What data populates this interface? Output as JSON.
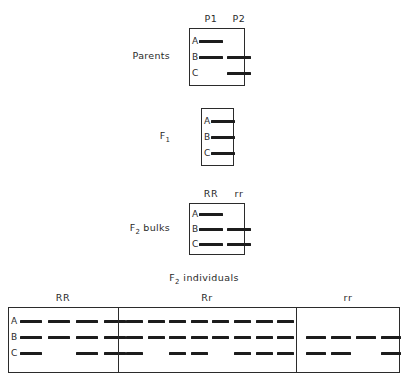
{
  "figure": {
    "type": "gel-band-diagram",
    "row_labels": [
      "A",
      "B",
      "C"
    ],
    "panels": [
      {
        "id": "parents",
        "side_label": "Parents",
        "side_label_sub": "",
        "column_headers": [
          "P1",
          "P2"
        ],
        "lane_count": 2,
        "bands": [
          {
            "row": "A",
            "lanes": [
              1
            ]
          },
          {
            "row": "B",
            "lanes": [
              1,
              2
            ]
          },
          {
            "row": "C",
            "lanes": [
              2
            ]
          }
        ]
      },
      {
        "id": "f1",
        "side_label": "F",
        "side_label_sub": "1",
        "column_headers": [],
        "lane_count": 1,
        "bands": [
          {
            "row": "A",
            "lanes": [
              1
            ]
          },
          {
            "row": "B",
            "lanes": [
              1
            ]
          },
          {
            "row": "C",
            "lanes": [
              1
            ]
          }
        ]
      },
      {
        "id": "f2-bulks",
        "side_label": "F",
        "side_label_sub": "2",
        "side_label_tail": " bulks",
        "column_headers": [
          "RR",
          "rr"
        ],
        "lane_count": 2,
        "bands": [
          {
            "row": "A",
            "lanes": [
              1
            ]
          },
          {
            "row": "B",
            "lanes": [
              1,
              2
            ]
          },
          {
            "row": "C",
            "lanes": [
              1,
              2
            ]
          }
        ]
      }
    ],
    "bottom_panel": {
      "id": "f2-individuals",
      "title": "F",
      "title_sub": "2",
      "title_tail": " individuals",
      "groups": [
        {
          "id": "group-rr-homozygous-dominant",
          "label": "RR",
          "lane_count": 4,
          "bands": [
            {
              "row": "A",
              "lanes": [
                1,
                2,
                3,
                4
              ]
            },
            {
              "row": "B",
              "lanes": [
                1,
                2,
                3,
                4
              ]
            },
            {
              "row": "C",
              "lanes": [
                1,
                3,
                4
              ]
            }
          ]
        },
        {
          "id": "group-rr-heterozygous",
          "label": "Rr",
          "lane_count": 8,
          "bands": [
            {
              "row": "A",
              "lanes": [
                1,
                2,
                3,
                4,
                5,
                6,
                7,
                8
              ]
            },
            {
              "row": "B",
              "lanes": [
                1,
                2,
                3,
                4,
                5,
                6,
                7,
                8
              ]
            },
            {
              "row": "C",
              "lanes": [
                1,
                3,
                4,
                6,
                7,
                8
              ]
            }
          ]
        },
        {
          "id": "group-rr-homozygous-recessive",
          "label": "rr",
          "lane_count": 4,
          "bands": [
            {
              "row": "A",
              "lanes": []
            },
            {
              "row": "B",
              "lanes": [
                1,
                2,
                3,
                4
              ]
            },
            {
              "row": "C",
              "lanes": [
                1,
                2,
                4
              ]
            }
          ]
        }
      ]
    },
    "colors": {
      "band": "#1c1c1c",
      "border": "#2b2b2b",
      "text": "#2a2a2a",
      "background": "#ffffff"
    }
  }
}
